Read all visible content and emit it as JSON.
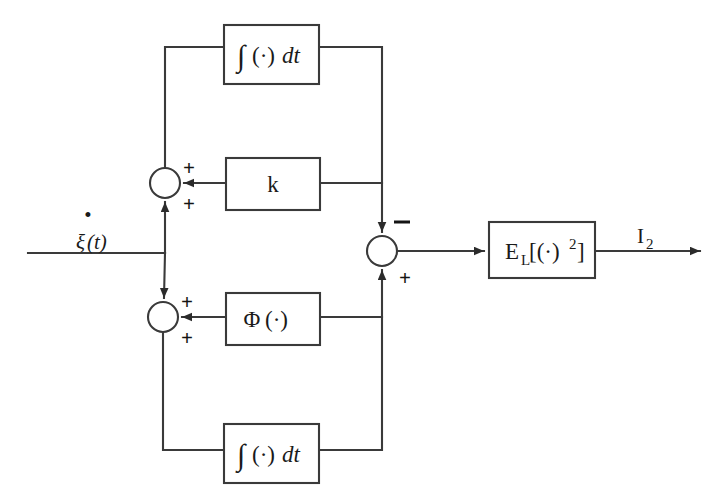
{
  "figure": {
    "type": "block-diagram",
    "title": "",
    "background_color": "#ffffff",
    "line_color": "#3a3a3a",
    "text_color": "#1a1a1a"
  },
  "signals": {
    "input_label": "ξ(t)",
    "input_label_base": "ξ",
    "input_label_arg": "(t)",
    "input_dot": "•",
    "output_label": "I",
    "output_subscript": "2"
  },
  "blocks": [
    {
      "id": "integrator-top",
      "name": "integrator-block-top",
      "label": "∫ (·)dt",
      "integral_glyph": "∫",
      "operand": "(·)",
      "differential": "dt",
      "x": 224,
      "y": 25,
      "w": 95,
      "h": 59
    },
    {
      "id": "gain-k",
      "name": "gain-block-k",
      "label": "k",
      "x": 226,
      "y": 158,
      "w": 94,
      "h": 52
    },
    {
      "id": "phi",
      "name": "nonlinearity-block-phi",
      "label": "Φ(·)",
      "symbol": "Φ",
      "operand": "(·)",
      "x": 226,
      "y": 293,
      "w": 94,
      "h": 52
    },
    {
      "id": "integrator-bottom",
      "name": "integrator-block-bottom",
      "label": "∫ (·)dt",
      "integral_glyph": "∫",
      "operand": "(·)",
      "differential": "dt",
      "x": 224,
      "y": 424,
      "w": 95,
      "h": 59
    },
    {
      "id": "expectation",
      "name": "expectation-square-block",
      "label": "E_L[(·)^2]",
      "symbol": "E",
      "subscript": "L",
      "bracket_open": "[(·)",
      "exponent": "2",
      "bracket_close": "]",
      "x": 489,
      "y": 222,
      "w": 106,
      "h": 56
    }
  ],
  "summing_junctions": [
    {
      "id": "sum-upper-left",
      "name": "summing-junction-upper-left",
      "cx": 165,
      "cy": 183,
      "r": 15,
      "signs": [
        {
          "text": "+",
          "x": 183,
          "y": 168,
          "input": "from-k-block"
        },
        {
          "text": "+",
          "x": 183,
          "y": 204,
          "input": "from-input-line"
        }
      ]
    },
    {
      "id": "sum-lower-left",
      "name": "summing-junction-lower-left",
      "cx": 163,
      "cy": 317,
      "r": 15,
      "signs": [
        {
          "text": "+",
          "x": 181,
          "y": 302,
          "input": "from-phi-block"
        },
        {
          "text": "+",
          "x": 181,
          "y": 338,
          "input": "from-bottom-integrator"
        }
      ]
    },
    {
      "id": "sum-right",
      "name": "summing-junction-right",
      "cx": 382,
      "cy": 251,
      "r": 15,
      "signs": [
        {
          "text": "−",
          "x": 399,
          "y": 226,
          "input": "from-upper-branch"
        },
        {
          "text": "+",
          "x": 399,
          "y": 278,
          "input": "from-lower-branch"
        }
      ]
    }
  ],
  "wires": [
    {
      "name": "input-wire",
      "from": "input-source",
      "to": "branch-node"
    },
    {
      "name": "upper-feedback-wire",
      "from": "branch-node",
      "to": "integrator-top"
    },
    {
      "name": "k-feedback-wire",
      "from": "right-vertical-bus",
      "to": "gain-k"
    },
    {
      "name": "phi-feedback-wire",
      "from": "right-vertical-bus",
      "to": "phi"
    },
    {
      "name": "lower-feedback-wire",
      "from": "branch-node",
      "to": "integrator-bottom"
    },
    {
      "name": "sum-to-expectation-wire",
      "from": "sum-right",
      "to": "expectation"
    },
    {
      "name": "output-wire",
      "from": "expectation",
      "to": "output-arrow"
    }
  ]
}
